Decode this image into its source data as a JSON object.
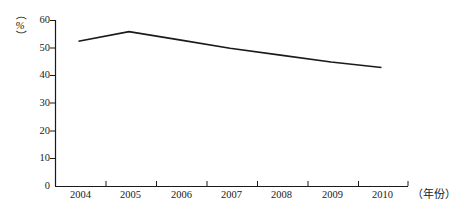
{
  "chart_data": {
    "type": "line",
    "title": "",
    "subtitle": "",
    "xlabel": "（年份）",
    "ylabel": "（%）",
    "categories": [
      "2004",
      "2005",
      "2006",
      "2007",
      "2008",
      "2009",
      "2010"
    ],
    "x": [
      2004,
      2005,
      2006,
      2007,
      2008,
      2009,
      2010
    ],
    "values": [
      52.5,
      56.0,
      53.0,
      50.0,
      47.5,
      45.0,
      43.0
    ],
    "series": [
      {
        "name": "",
        "values": [
          52.5,
          56.0,
          53.0,
          50.0,
          47.5,
          45.0,
          43.0
        ]
      }
    ],
    "ylim": [
      0,
      60
    ],
    "ytick_values": [
      0,
      10,
      20,
      30,
      40,
      50,
      60
    ],
    "ytick_labels": [
      "0",
      "10",
      "20",
      "30",
      "40",
      "50",
      "60"
    ],
    "xtick_labels": [
      "2004",
      "2005",
      "2006",
      "2007",
      "2008",
      "2009",
      "2010"
    ],
    "grid": false,
    "legend": false,
    "legend_position": "none",
    "line_color": "#1a1a1a",
    "background_color": "#ffffff",
    "markers": false
  },
  "axes": {
    "y_unit_open_paren": "（",
    "y_unit_symbol": "%",
    "y_unit_close_paren": "）",
    "x_unit": "（年份）"
  }
}
